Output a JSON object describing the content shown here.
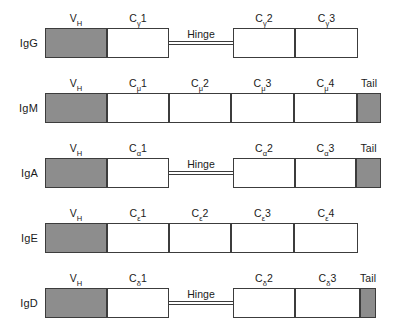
{
  "figure": {
    "colors": {
      "variable_domain_fill": "#8d8d8d",
      "constant_domain_fill": "#ffffff",
      "tail_fill": "#8d8d8d",
      "outline": "#3c3c3c",
      "text": "#1a1a1a",
      "background": "#ffffff"
    },
    "hinge_label": "Hinge",
    "tail_label": "Tail",
    "variable_label": "V",
    "variable_sub": "H"
  },
  "rows": [
    {
      "isotype": "IgG",
      "y": 28,
      "segments": [
        {
          "name": "variable-heavy",
          "label": "V",
          "sub": "H",
          "sup": "",
          "x": 45,
          "w": 62,
          "fill": "gray"
        },
        {
          "name": "constant-gamma-1",
          "label": "C",
          "sub": "γ",
          "sup": "1",
          "x": 107,
          "w": 62,
          "fill": "white"
        },
        {
          "name": "constant-gamma-2",
          "label": "C",
          "sub": "γ",
          "sup": "2",
          "x": 233,
          "w": 62,
          "fill": "white"
        },
        {
          "name": "constant-gamma-3",
          "label": "C",
          "sub": "γ",
          "sup": "3",
          "x": 295,
          "w": 63,
          "fill": "white"
        }
      ],
      "hinge": {
        "x": 169,
        "w": 64,
        "label": "Hinge"
      },
      "tail": null
    },
    {
      "isotype": "IgM",
      "y": 93,
      "segments": [
        {
          "name": "variable-heavy",
          "label": "V",
          "sub": "H",
          "sup": "",
          "x": 45,
          "w": 62,
          "fill": "gray"
        },
        {
          "name": "constant-mu-1",
          "label": "C",
          "sub": "μ",
          "sup": "1",
          "x": 107,
          "w": 62,
          "fill": "white"
        },
        {
          "name": "constant-mu-2",
          "label": "C",
          "sub": "μ",
          "sup": "2",
          "x": 169,
          "w": 62,
          "fill": "white"
        },
        {
          "name": "constant-mu-3",
          "label": "C",
          "sub": "μ",
          "sup": "3",
          "x": 231,
          "w": 63,
          "fill": "white"
        },
        {
          "name": "constant-mu-4",
          "label": "C",
          "sub": "μ",
          "sup": "4",
          "x": 294,
          "w": 63,
          "fill": "white"
        },
        {
          "name": "tail-piece",
          "label": "Tail",
          "sub": "",
          "sup": "",
          "x": 357,
          "w": 24,
          "fill": "gray"
        }
      ],
      "hinge": null,
      "tail": "Tail"
    },
    {
      "isotype": "IgA",
      "y": 158,
      "segments": [
        {
          "name": "variable-heavy",
          "label": "V",
          "sub": "H",
          "sup": "",
          "x": 45,
          "w": 62,
          "fill": "gray"
        },
        {
          "name": "constant-alpha-1",
          "label": "C",
          "sub": "α",
          "sup": "1",
          "x": 107,
          "w": 62,
          "fill": "white"
        },
        {
          "name": "constant-alpha-2",
          "label": "C",
          "sub": "α",
          "sup": "2",
          "x": 233,
          "w": 62,
          "fill": "white"
        },
        {
          "name": "constant-alpha-3",
          "label": "C",
          "sub": "α",
          "sup": "3",
          "x": 295,
          "w": 61,
          "fill": "white"
        },
        {
          "name": "tail-piece",
          "label": "Tail",
          "sub": "",
          "sup": "",
          "x": 356,
          "w": 25,
          "fill": "gray"
        }
      ],
      "hinge": {
        "x": 169,
        "w": 64,
        "label": "Hinge"
      },
      "tail": "Tail"
    },
    {
      "isotype": "IgE",
      "y": 223,
      "segments": [
        {
          "name": "variable-heavy",
          "label": "V",
          "sub": "H",
          "sup": "",
          "x": 45,
          "w": 62,
          "fill": "gray"
        },
        {
          "name": "constant-epsilon-1",
          "label": "C",
          "sub": "ε",
          "sup": "1",
          "x": 107,
          "w": 62,
          "fill": "white"
        },
        {
          "name": "constant-epsilon-2",
          "label": "C",
          "sub": "ε",
          "sup": "2",
          "x": 169,
          "w": 62,
          "fill": "white"
        },
        {
          "name": "constant-epsilon-3",
          "label": "C",
          "sub": "ε",
          "sup": "3",
          "x": 231,
          "w": 63,
          "fill": "white"
        },
        {
          "name": "constant-epsilon-4",
          "label": "C",
          "sub": "ε",
          "sup": "4",
          "x": 294,
          "w": 64,
          "fill": "white"
        }
      ],
      "hinge": null,
      "tail": null
    },
    {
      "isotype": "IgD",
      "y": 288,
      "segments": [
        {
          "name": "variable-heavy",
          "label": "V",
          "sub": "H",
          "sup": "",
          "x": 45,
          "w": 62,
          "fill": "gray"
        },
        {
          "name": "constant-delta-1",
          "label": "C",
          "sub": "δ",
          "sup": "1",
          "x": 107,
          "w": 62,
          "fill": "white"
        },
        {
          "name": "constant-delta-2",
          "label": "C",
          "sub": "δ",
          "sup": "2",
          "x": 233,
          "w": 62,
          "fill": "white"
        },
        {
          "name": "constant-delta-3",
          "label": "C",
          "sub": "δ",
          "sup": "3",
          "x": 295,
          "w": 65,
          "fill": "white"
        },
        {
          "name": "tail-piece",
          "label": "Tail",
          "sub": "",
          "sup": "",
          "x": 360,
          "w": 16,
          "fill": "gray"
        }
      ],
      "hinge": {
        "x": 169,
        "w": 64,
        "label": "Hinge"
      },
      "tail": "Tail"
    }
  ]
}
